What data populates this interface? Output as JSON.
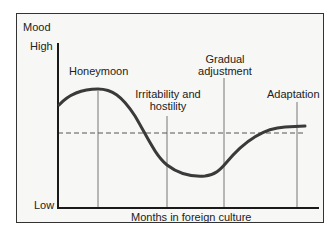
{
  "diagram": {
    "y_axis_title": "Mood",
    "y_high_label": "High",
    "y_low_label": "Low",
    "x_axis_label": "Months in foreign culture",
    "stages": [
      {
        "label_line1": "Honeymoon",
        "label_line2": ""
      },
      {
        "label_line1": "Irritability and",
        "label_line2": "hostility"
      },
      {
        "label_line1": "Gradual",
        "label_line2": "adjustment"
      },
      {
        "label_line1": "Adaptation",
        "label_line2": ""
      }
    ],
    "baseline": "dashed reference line",
    "colors": {
      "curve": "#3a3a3a",
      "axes": "#1a1a1a",
      "background": "#f7f7f5"
    }
  }
}
